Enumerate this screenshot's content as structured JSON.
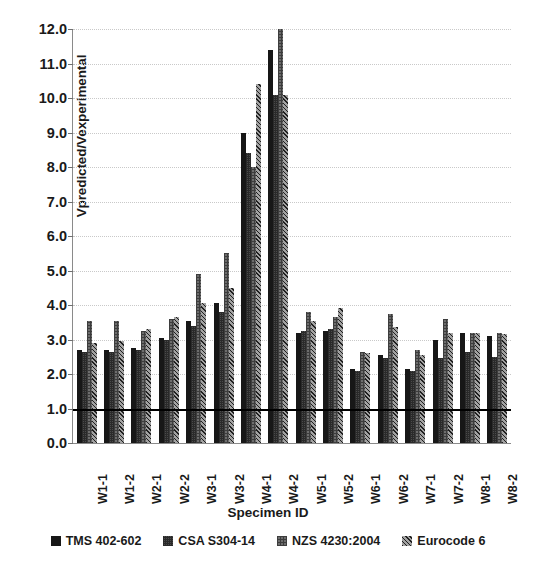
{
  "chart_data": {
    "type": "bar",
    "title": "",
    "xlabel": "Specimen ID",
    "ylabel": "Vpredicted/Vexperimental",
    "ylim": [
      0.0,
      12.0
    ],
    "ytick_step": 1.0,
    "yticks": [
      "0.0",
      "1.0",
      "2.0",
      "3.0",
      "4.0",
      "5.0",
      "6.0",
      "7.0",
      "8.0",
      "9.0",
      "10.0",
      "11.0",
      "12.0"
    ],
    "grid": true,
    "grid_axis": "y",
    "legend_position": "bottom",
    "reference_line": {
      "value": 1.0,
      "color": "#000000",
      "label": ""
    },
    "categories": [
      "W1-1",
      "W1-2",
      "W2-1",
      "W2-2",
      "W3-1",
      "W3-2",
      "W4-1",
      "W4-2",
      "W5-1",
      "W5-2",
      "W6-1",
      "W6-2",
      "W7-1",
      "W7-2",
      "W8-1",
      "W8-2"
    ],
    "series": [
      {
        "name": "TMS 402-602",
        "color": "#171717",
        "values": [
          2.7,
          2.7,
          2.75,
          3.05,
          3.55,
          4.05,
          9.0,
          11.4,
          3.2,
          3.25,
          2.15,
          2.55,
          2.15,
          3.0,
          3.2,
          3.1
        ]
      },
      {
        "name": "CSA S304-14",
        "color": "#4a4a4a",
        "values": [
          2.65,
          2.65,
          2.7,
          3.0,
          3.4,
          3.8,
          8.4,
          10.1,
          3.25,
          3.3,
          2.1,
          2.45,
          2.1,
          2.45,
          2.65,
          2.5
        ]
      },
      {
        "name": "NZS 4230:2004",
        "color": "#6d6d6d",
        "values": [
          3.55,
          3.55,
          3.25,
          3.6,
          4.9,
          5.5,
          8.0,
          12.0,
          3.8,
          3.65,
          2.65,
          3.75,
          2.7,
          3.6,
          3.2,
          3.2
        ]
      },
      {
        "name": "Eurocode 6",
        "color": "#5e5e5e",
        "values": [
          2.9,
          2.95,
          3.3,
          3.65,
          4.05,
          4.5,
          10.4,
          10.1,
          3.55,
          3.9,
          2.6,
          3.35,
          2.55,
          3.2,
          3.2,
          3.15
        ]
      }
    ]
  },
  "axis": {
    "y_title": "Vpredicted/Vexperimental",
    "x_title": "Specimen ID"
  }
}
